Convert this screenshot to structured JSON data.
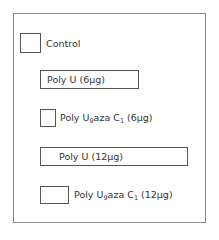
{
  "legend": {
    "items": [
      {
        "id": "control",
        "label": "Control"
      },
      {
        "id": "polyu-6",
        "label": "Poly U (6µg)"
      },
      {
        "id": "polyu9azac1-6",
        "label_main": "Poly U",
        "sub1": "9",
        "label_mid": "aza C",
        "sub2": "1",
        "label_end": " (6µg)"
      },
      {
        "id": "polyu-12",
        "label": "Poly U  (12µg)"
      },
      {
        "id": "polyu9azac1-12",
        "label_main": "Poly U",
        "sub1": "9",
        "label_mid": "aza C",
        "sub2": "1",
        "label_end": " (12µg)"
      }
    ]
  }
}
